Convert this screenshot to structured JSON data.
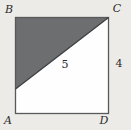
{
  "figure": {
    "vertices": {
      "top_left": "B",
      "top_right": "C",
      "bottom_left": "A",
      "bottom_right": "D"
    },
    "labels": {
      "hypotenuse": "5",
      "right_side": "4"
    },
    "colors": {
      "background": "#edebe7",
      "square_fill": "#fefefe",
      "square_stroke": "#58595b",
      "shaded_triangle": "#6d6e70",
      "diagonal_stroke": "#3f4041",
      "text": "#2b2b2b"
    }
  }
}
